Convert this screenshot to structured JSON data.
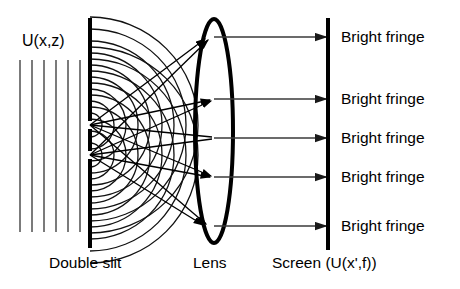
{
  "figure": {
    "width": 460,
    "height": 289,
    "background": "#ffffff",
    "stroke_color": "#000000",
    "thin_stroke_color": "#4d4d4d"
  },
  "labels": {
    "input_field": "U(x,z)",
    "double_slit": "Double slit",
    "lens": "Lens",
    "screen": "Screen (U(x',f))"
  },
  "fringes": [
    {
      "label": "Bright fringe",
      "y": 37
    },
    {
      "label": "Bright fringe",
      "y": 99
    },
    {
      "label": "Bright fringe",
      "y": 138
    },
    {
      "label": "Bright fringe",
      "y": 177
    },
    {
      "label": "Bright fringe",
      "y": 226
    }
  ],
  "geometry": {
    "plane_wave": {
      "count": 6,
      "x_start": 20,
      "x_spacing": 12,
      "y_top": 60,
      "y_bottom": 232
    },
    "barrier": {
      "x": 90,
      "y_top": 18,
      "y_bottom": 248,
      "slits": [
        {
          "y_center": 125,
          "gap": 7
        },
        {
          "y_center": 155,
          "gap": 7
        }
      ]
    },
    "wave_sources": [
      {
        "x": 90,
        "y": 125,
        "rings": 9,
        "ring_spacing": 12
      },
      {
        "x": 90,
        "y": 155,
        "rings": 9,
        "ring_spacing": 12
      }
    ],
    "lens": {
      "cx": 214,
      "cy": 131,
      "rx": 19,
      "ry": 112
    },
    "screen": {
      "x": 327,
      "y_top": 18,
      "y_bottom": 250
    },
    "rays_to_lens": [
      {
        "from_x": 90,
        "from_y": 125,
        "to_x": 207,
        "to_y": 37
      },
      {
        "from_x": 90,
        "from_y": 155,
        "to_x": 210,
        "to_y": 37
      },
      {
        "from_x": 90,
        "from_y": 125,
        "to_x": 212,
        "to_y": 99
      },
      {
        "from_x": 90,
        "from_y": 155,
        "to_x": 213,
        "to_y": 99
      },
      {
        "from_x": 90,
        "from_y": 125,
        "to_x": 214,
        "to_y": 138
      },
      {
        "from_x": 90,
        "from_y": 155,
        "to_x": 214,
        "to_y": 138
      },
      {
        "from_x": 90,
        "from_y": 125,
        "to_x": 213,
        "to_y": 177
      },
      {
        "from_x": 90,
        "from_y": 155,
        "to_x": 212,
        "to_y": 177
      },
      {
        "from_x": 90,
        "from_y": 125,
        "to_x": 208,
        "to_y": 226
      },
      {
        "from_x": 90,
        "from_y": 155,
        "to_x": 206,
        "to_y": 226
      }
    ],
    "rays_to_screen": [
      {
        "from_x": 214,
        "to_x": 327,
        "y": 37
      },
      {
        "from_x": 214,
        "to_x": 327,
        "y": 99
      },
      {
        "from_x": 214,
        "to_x": 327,
        "y": 138
      },
      {
        "from_x": 214,
        "to_x": 327,
        "y": 177
      },
      {
        "from_x": 214,
        "to_x": 327,
        "y": 226
      }
    ]
  },
  "label_positions": {
    "input_field": {
      "x": 22,
      "y": 33
    },
    "double_slit": {
      "x": 49,
      "y": 253
    },
    "lens": {
      "x": 192,
      "y": 253
    },
    "screen": {
      "x": 272,
      "y": 253
    },
    "fringe_text_x": 341
  }
}
